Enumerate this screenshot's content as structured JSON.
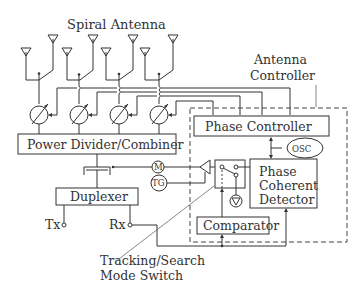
{
  "title": "Spiral Antenna",
  "labels": {
    "antenna_controller_1": "Antenna",
    "antenna_controller_2": "Controller",
    "phase_controller": "Phase Controller",
    "osc": "OSC",
    "power_divider": "Power Divider/Combiner",
    "motor": "M",
    "tacho": "TG",
    "phase_det_1": "Phase",
    "phase_det_2": "Coherent",
    "phase_det_3": "Detector",
    "duplexer": "Duplexer",
    "tx": "Tx",
    "rx": "Rx",
    "comparator": "Comparator",
    "mode_switch_1": "Tracking/Search",
    "mode_switch_2": "Mode Switch"
  },
  "antenna_elements": 8,
  "phase_shifters": 4,
  "colors": {
    "line": "#333333",
    "background": "#ffffff"
  }
}
